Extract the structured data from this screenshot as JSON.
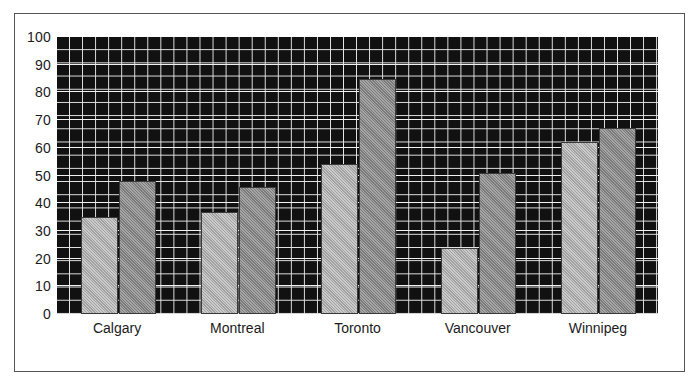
{
  "chart_data": {
    "type": "bar",
    "title": "",
    "subtitle": "",
    "xlabel": "",
    "ylabel": "",
    "categories": [
      "Calgary",
      "Montreal",
      "Toronto",
      "Vancouver",
      "Winnipeg"
    ],
    "series": [
      {
        "name": "Series 1",
        "color": "#b4b4b4",
        "values": [
          35,
          37,
          54,
          24,
          62
        ]
      },
      {
        "name": "Series 2",
        "color": "#8c8c8c",
        "values": [
          48,
          46,
          85,
          51,
          67
        ]
      }
    ],
    "ylim": [
      0,
      100
    ],
    "ytick_labels": [
      "100",
      "90",
      "80",
      "70",
      "60",
      "50",
      "40",
      "30",
      "20",
      "10",
      "0"
    ],
    "ytick_values": [
      100,
      90,
      80,
      70,
      60,
      50,
      40,
      30,
      20,
      10,
      0
    ],
    "grid": true,
    "grid_style": "graph-paper",
    "plot_background": "#111111",
    "grid_color": "#e8e8e8",
    "legend": false,
    "legend_position": "none",
    "frame_border_color": "#555555"
  }
}
